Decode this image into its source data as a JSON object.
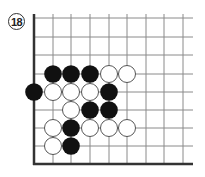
{
  "diagram": {
    "label": "18",
    "type": "go-board-corner",
    "grid": {
      "x_lines": [
        34,
        53,
        71,
        90,
        109,
        127,
        146,
        164,
        183
      ],
      "y_lines": [
        18,
        37,
        55,
        74,
        92,
        110,
        128,
        146,
        164
      ],
      "left_edge_x": 34,
      "bottom_edge_y": 164,
      "right_end_x": 193,
      "top_end_y": 14
    },
    "colors": {
      "line": "#8a8a8a",
      "edge": "#333333",
      "black": "#111111",
      "white": "#ffffff",
      "white_outline": "#444444"
    },
    "stones": [
      {
        "color": "black",
        "col": 1,
        "row": 3
      },
      {
        "color": "black",
        "col": 2,
        "row": 3
      },
      {
        "color": "black",
        "col": 3,
        "row": 3
      },
      {
        "color": "white",
        "col": 4,
        "row": 3
      },
      {
        "color": "white",
        "col": 5,
        "row": 3
      },
      {
        "color": "black",
        "col": 0,
        "row": 4
      },
      {
        "color": "white",
        "col": 1,
        "row": 4
      },
      {
        "color": "white",
        "col": 2,
        "row": 4
      },
      {
        "color": "white",
        "col": 3,
        "row": 4
      },
      {
        "color": "black",
        "col": 4,
        "row": 4
      },
      {
        "color": "white",
        "col": 2,
        "row": 5
      },
      {
        "color": "black",
        "col": 3,
        "row": 5
      },
      {
        "color": "black",
        "col": 4,
        "row": 5
      },
      {
        "color": "white",
        "col": 1,
        "row": 6
      },
      {
        "color": "black",
        "col": 2,
        "row": 6
      },
      {
        "color": "white",
        "col": 3,
        "row": 6
      },
      {
        "color": "white",
        "col": 4,
        "row": 6
      },
      {
        "color": "white",
        "col": 5,
        "row": 6
      },
      {
        "color": "white",
        "col": 1,
        "row": 7
      },
      {
        "color": "black",
        "col": 2,
        "row": 7
      }
    ]
  }
}
